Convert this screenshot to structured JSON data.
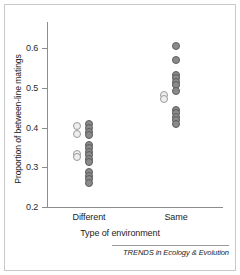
{
  "figure": {
    "footer_credit": "TRENDS in Ecology & Evolution"
  },
  "chart_data": {
    "type": "scatter",
    "title": "",
    "xlabel": "Type of environment",
    "ylabel": "Proportion of between-line matings",
    "categories": [
      "Different",
      "Same"
    ],
    "ylim": [
      0.2,
      0.62
    ],
    "yticks": [
      0.2,
      0.3,
      0.4,
      0.5,
      0.6
    ],
    "ytick_labels": [
      "0.2",
      "0.3",
      "0.4",
      "0.5",
      "0.6"
    ],
    "grid": false,
    "legend": "none",
    "marker_styles": {
      "open": "#eeeeee",
      "filled": "#8a8a8a"
    },
    "series": [
      {
        "name": "Different",
        "category": "Different",
        "points": [
          {
            "value": 0.405,
            "style": "open",
            "offset": -1
          },
          {
            "value": 0.383,
            "style": "open",
            "offset": -1
          },
          {
            "value": 0.334,
            "style": "open",
            "offset": -1
          },
          {
            "value": 0.325,
            "style": "open",
            "offset": -1
          },
          {
            "value": 0.41,
            "style": "filled",
            "offset": 0
          },
          {
            "value": 0.398,
            "style": "filled",
            "offset": 0
          },
          {
            "value": 0.389,
            "style": "filled",
            "offset": 0
          },
          {
            "value": 0.38,
            "style": "filled",
            "offset": 0
          },
          {
            "value": 0.357,
            "style": "filled",
            "offset": 0
          },
          {
            "value": 0.348,
            "style": "filled",
            "offset": 0
          },
          {
            "value": 0.339,
            "style": "filled",
            "offset": 0
          },
          {
            "value": 0.33,
            "style": "filled",
            "offset": 0
          },
          {
            "value": 0.321,
            "style": "filled",
            "offset": 0
          },
          {
            "value": 0.312,
            "style": "filled",
            "offset": 0
          },
          {
            "value": 0.288,
            "style": "filled",
            "offset": 0
          },
          {
            "value": 0.279,
            "style": "filled",
            "offset": 0
          },
          {
            "value": 0.27,
            "style": "filled",
            "offset": 0
          },
          {
            "value": 0.261,
            "style": "filled",
            "offset": 0
          }
        ]
      },
      {
        "name": "Same",
        "category": "Same",
        "points": [
          {
            "value": 0.605,
            "style": "filled",
            "offset": 0
          },
          {
            "value": 0.57,
            "style": "filled",
            "offset": 0
          },
          {
            "value": 0.533,
            "style": "filled",
            "offset": 0
          },
          {
            "value": 0.524,
            "style": "filled",
            "offset": 0
          },
          {
            "value": 0.515,
            "style": "filled",
            "offset": 0
          },
          {
            "value": 0.506,
            "style": "filled",
            "offset": 0
          },
          {
            "value": 0.492,
            "style": "filled",
            "offset": 0
          },
          {
            "value": 0.483,
            "style": "open",
            "offset": -1
          },
          {
            "value": 0.472,
            "style": "open",
            "offset": -1
          },
          {
            "value": 0.445,
            "style": "filled",
            "offset": 0
          },
          {
            "value": 0.436,
            "style": "filled",
            "offset": 0
          },
          {
            "value": 0.427,
            "style": "filled",
            "offset": 0
          },
          {
            "value": 0.418,
            "style": "filled",
            "offset": 0
          },
          {
            "value": 0.409,
            "style": "filled",
            "offset": 0
          }
        ]
      }
    ]
  }
}
